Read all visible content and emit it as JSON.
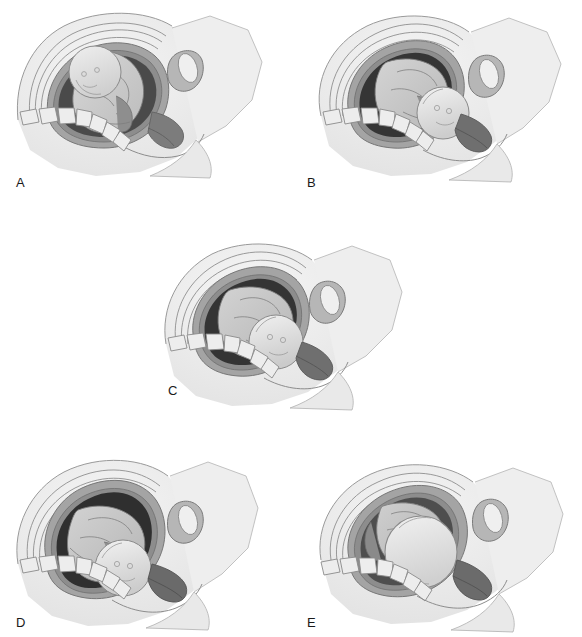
{
  "figure": {
    "style": "grayscale pencil medical illustration",
    "background_color": "#ffffff",
    "panel_count": 5
  },
  "palette": {
    "background": "#ffffff",
    "maternal_soft_tissue": "#ececec",
    "maternal_tissue_mid": "#dcdcdc",
    "abdominal_wall_line": "#8f8f8f",
    "uterine_wall": "#9a9a9a",
    "uterine_wall_dark": "#7a7a7a",
    "amniotic_cavity_dark": "#3a3a3a",
    "amniotic_cavity_darkest": "#262626",
    "fetal_body": "#c9c9c9",
    "fetal_body_light": "#d9d9d9",
    "fetal_head": "#e4e4e4",
    "vertebra_fill": "#ededed",
    "vertebra_line": "#8a8a8a",
    "bladder_fill": "#efefef",
    "outline": "#6d6d6d",
    "label_text": "#1a1a1a"
  },
  "panels": [
    {
      "id": "A",
      "label": "A",
      "label_x": 16,
      "label_y": 176,
      "panel_x": 0,
      "panel_y": 0,
      "caption": "Fetal head floating above the pelvic inlet; uterus high and ovoid",
      "station": "ballotable / high floating",
      "head_cx": 95,
      "head_cy": 72,
      "head_r": 34,
      "uterus_tilt": -22,
      "amniotic_tone": "#4a4a4a"
    },
    {
      "id": "B",
      "label": "B",
      "label_x": 16,
      "label_y": 176,
      "panel_x": 291,
      "panel_y": 0,
      "caption": "Head descending toward the inlet; vertex beginning to engage",
      "station": "engaging",
      "head_cx": 152,
      "head_cy": 113,
      "head_r": 33,
      "uterus_tilt": -18,
      "amniotic_tone": "#353535"
    },
    {
      "id": "C",
      "label": "C",
      "label_x": 22,
      "label_y": 152,
      "panel_x": 146,
      "panel_y": 232,
      "caption": "Head engaged at the level of the ischial spines",
      "station": "engaged / zero station",
      "head_cx": 130,
      "head_cy": 110,
      "head_r": 34,
      "uterus_tilt": -14,
      "amniotic_tone": "#343434"
    },
    {
      "id": "D",
      "label": "D",
      "label_x": 16,
      "label_y": 168,
      "panel_x": 0,
      "panel_y": 448,
      "caption": "Head low in the mid pelvis, flexed against the perineum",
      "station": "deep descent",
      "head_cx": 123,
      "head_cy": 120,
      "head_r": 33,
      "uterus_tilt": -16,
      "amniotic_tone": "#2f2f2f"
    },
    {
      "id": "E",
      "label": "E",
      "label_x": 16,
      "label_y": 168,
      "panel_x": 291,
      "panel_y": 448,
      "caption": "Head at the pelvic outlet, distending the perineum",
      "station": "crowning",
      "head_cx": 130,
      "head_cy": 104,
      "head_r": 40,
      "uterus_tilt": -10,
      "amniotic_tone": "#4e4e4e"
    }
  ],
  "anatomy_parts": [
    "maternal-abdominal-wall",
    "uterine-wall",
    "amniotic-cavity",
    "fetal-head",
    "fetal-torso",
    "fetal-limbs",
    "sacral-vertebrae",
    "pubic-symphysis",
    "urinary-bladder",
    "cervix",
    "perineum",
    "maternal-thigh"
  ],
  "vertebrae_count": 7
}
